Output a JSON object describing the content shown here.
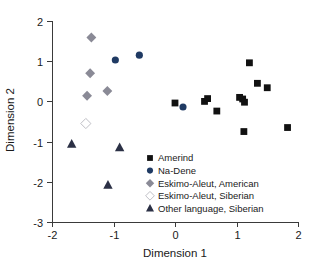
{
  "chart_data": {
    "type": "scatter",
    "title": "",
    "xlabel": "Dimension 1",
    "ylabel": "Dimension 2",
    "xlim": [
      -2,
      2
    ],
    "ylim": [
      -3,
      2
    ],
    "xticks": [
      -2,
      -1,
      0,
      1,
      2
    ],
    "yticks": [
      -3,
      -2,
      -1,
      0,
      1,
      2
    ],
    "xtick_labels": [
      "-2",
      "-1",
      "0",
      "1",
      "2"
    ],
    "ytick_labels": [
      "-3",
      "-2",
      "-1",
      "0",
      "1",
      "2"
    ],
    "grid": false,
    "legend_position": "center-right-inside",
    "series": [
      {
        "name": "Amerind",
        "marker": "square-filled",
        "color": "#111111",
        "points": [
          {
            "x": 0.0,
            "y": -0.04
          },
          {
            "x": 0.48,
            "y": 0.0
          },
          {
            "x": 0.53,
            "y": 0.07
          },
          {
            "x": 0.68,
            "y": -0.24
          },
          {
            "x": 1.05,
            "y": 0.1
          },
          {
            "x": 1.1,
            "y": 0.06
          },
          {
            "x": 1.13,
            "y": -0.02
          },
          {
            "x": 1.12,
            "y": -0.75
          },
          {
            "x": 1.21,
            "y": 0.96
          },
          {
            "x": 1.34,
            "y": 0.45
          },
          {
            "x": 1.5,
            "y": 0.34
          },
          {
            "x": 1.83,
            "y": -0.65
          }
        ]
      },
      {
        "name": "Na-Dene",
        "marker": "circle-filled",
        "color": "#1f3a63",
        "points": [
          {
            "x": -0.97,
            "y": 1.03
          },
          {
            "x": -0.58,
            "y": 1.15
          },
          {
            "x": 0.13,
            "y": -0.14
          }
        ]
      },
      {
        "name": "Eskimo-Aleut, American",
        "marker": "diamond-filled",
        "color": "#8a8a96",
        "points": [
          {
            "x": -1.36,
            "y": 1.59
          },
          {
            "x": -1.38,
            "y": 0.7
          },
          {
            "x": -1.43,
            "y": 0.14
          },
          {
            "x": -1.1,
            "y": 0.26
          }
        ]
      },
      {
        "name": "Eskimo-Aleut, Siberian",
        "marker": "diamond-open",
        "color": "#bfbfc6",
        "points": [
          {
            "x": -1.45,
            "y": -0.55
          }
        ]
      },
      {
        "name": "Other language, Siberian",
        "marker": "triangle-filled",
        "color": "#2b3045",
        "points": [
          {
            "x": -1.68,
            "y": -1.06
          },
          {
            "x": -0.9,
            "y": -1.15
          },
          {
            "x": -1.09,
            "y": -2.08
          }
        ]
      }
    ]
  },
  "legend": {
    "entries": [
      {
        "label": "Amerind"
      },
      {
        "label": "Na-Dene"
      },
      {
        "label": "Eskimo-Aleut, American"
      },
      {
        "label": "Eskimo-Aleut, Siberian"
      },
      {
        "label": "Other language, Siberian"
      }
    ]
  }
}
